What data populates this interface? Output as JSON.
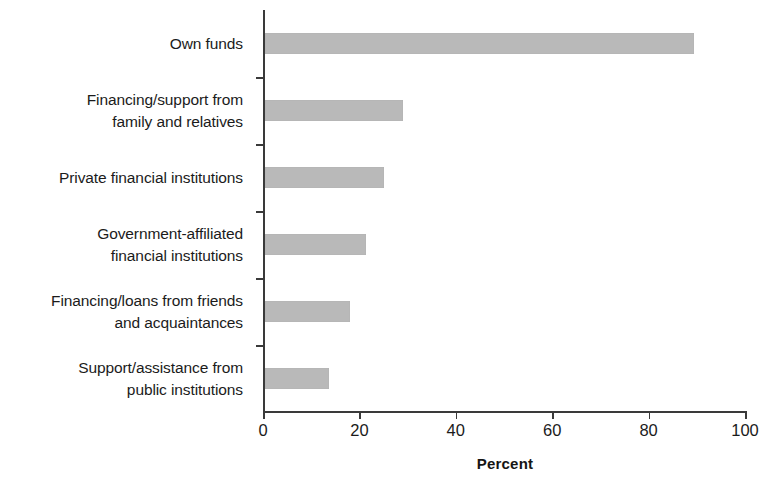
{
  "chart_data": {
    "type": "bar",
    "orientation": "horizontal",
    "title": "",
    "subtitle": "",
    "xlabel": "Percent",
    "ylabel": "",
    "xlim": [
      0,
      100
    ],
    "xticks": [
      0,
      20,
      40,
      60,
      80,
      100
    ],
    "xtick_labels": [
      "0",
      "20",
      "40",
      "60",
      "80",
      "100"
    ],
    "grid": false,
    "legend": false,
    "bar_color": "#b9b9b9",
    "axis_color": "#3a3a3a",
    "categories": [
      "Own funds",
      "Financing/support from\nfamily and relatives",
      "Private financial institutions",
      "Government-affiliated\nfinancial institutions",
      "Financing/loans from friends\nand acquaintances",
      "Support/assistance from\npublic institutions"
    ],
    "values": [
      89,
      28.8,
      24.7,
      21,
      17.8,
      13.3
    ]
  }
}
